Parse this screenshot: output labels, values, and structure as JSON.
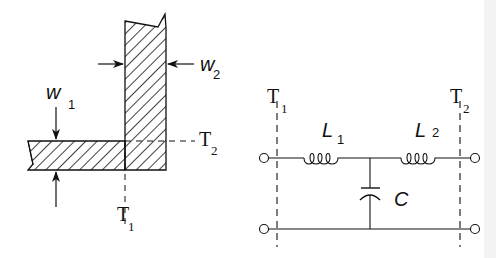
{
  "left_diagram": {
    "title": "Microstrip right-angle bend",
    "labels": {
      "w1_main": "w",
      "w1_sub": "1",
      "w2_main": "w",
      "w2_sub": "2",
      "t1_main": "T",
      "t1_sub": "1",
      "t2_main": "T",
      "t2_sub": "2"
    }
  },
  "right_diagram": {
    "title": "Equivalent circuit",
    "labels": {
      "t1_main": "T",
      "t1_sub": "1",
      "t2_main": "T",
      "t2_sub": "2",
      "l1_main": "L",
      "l1_sub": "1",
      "l2_main": "L",
      "l2_sub": "2",
      "c_main": "C"
    },
    "components": [
      "L1 series inductor",
      "C shunt capacitor",
      "L2 series inductor"
    ]
  },
  "colors": {
    "ink": "#111111",
    "background": "#ffffff"
  }
}
